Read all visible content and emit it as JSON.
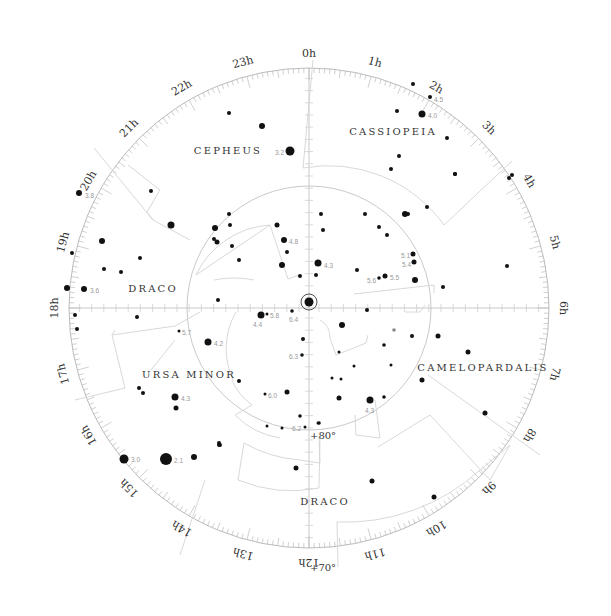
{
  "chart_data": {
    "type": "polar_star_chart",
    "title": "",
    "center": {
      "x": 309,
      "y": 308
    },
    "outer_radius": 240,
    "hour_labels": [
      "0h",
      "1h",
      "2h",
      "3h",
      "4h",
      "5h",
      "6h",
      "7h",
      "8h",
      "9h",
      "10h",
      "11h",
      "12h",
      "13h",
      "14h",
      "15h",
      "16h",
      "17h",
      "18h",
      "19h",
      "20h",
      "21h",
      "22h",
      "23h"
    ],
    "declination_circles": [
      {
        "label": "+80°",
        "radius": 122
      },
      {
        "label": "+70°",
        "radius": 240
      }
    ],
    "constellations": [
      {
        "name": "CEPHEUS",
        "x": 228,
        "y": 151
      },
      {
        "name": "CASSIOPEIA",
        "x": 393,
        "y": 132
      },
      {
        "name": "DRACO",
        "x": 153,
        "y": 289
      },
      {
        "name": "URSA MINOR",
        "x": 189,
        "y": 375
      },
      {
        "name": "CAMELOPARDALIS",
        "x": 483,
        "y": 368
      },
      {
        "name": "DRACO",
        "x": 325,
        "y": 502
      }
    ],
    "stars": [
      {
        "x": 309,
        "y": 302,
        "r": 4.5,
        "mag": "",
        "ring": true
      },
      {
        "x": 290,
        "y": 151,
        "r": 4.5,
        "mag": "3.2",
        "lx": 275,
        "ly": 153
      },
      {
        "x": 262,
        "y": 126,
        "r": 3,
        "mag": ""
      },
      {
        "x": 229,
        "y": 113,
        "r": 2,
        "mag": ""
      },
      {
        "x": 413,
        "y": 84,
        "r": 2,
        "mag": ""
      },
      {
        "x": 430,
        "y": 97,
        "r": 2,
        "mag": "4.5",
        "lx": 434,
        "ly": 100
      },
      {
        "x": 422,
        "y": 114,
        "r": 3.5,
        "mag": "4.0",
        "lx": 428,
        "ly": 116
      },
      {
        "x": 397,
        "y": 111,
        "r": 2,
        "mag": ""
      },
      {
        "x": 447,
        "y": 138,
        "r": 2,
        "mag": ""
      },
      {
        "x": 399,
        "y": 156,
        "r": 2,
        "mag": ""
      },
      {
        "x": 391,
        "y": 169,
        "r": 2,
        "mag": ""
      },
      {
        "x": 455,
        "y": 174,
        "r": 2,
        "mag": ""
      },
      {
        "x": 427,
        "y": 207,
        "r": 2,
        "mag": ""
      },
      {
        "x": 408,
        "y": 214,
        "r": 2,
        "mag": ""
      },
      {
        "x": 509,
        "y": 178,
        "r": 2,
        "mag": ""
      },
      {
        "x": 512,
        "y": 175,
        "r": 2,
        "mag": ""
      },
      {
        "x": 455,
        "y": 174,
        "r": 2,
        "mag": ""
      },
      {
        "x": 507,
        "y": 266,
        "r": 2,
        "mag": ""
      },
      {
        "x": 443,
        "y": 287,
        "r": 2,
        "mag": ""
      },
      {
        "x": 79,
        "y": 193,
        "r": 3,
        "mag": "3.8",
        "lx": 85,
        "ly": 196
      },
      {
        "x": 151,
        "y": 191,
        "r": 2,
        "mag": ""
      },
      {
        "x": 171,
        "y": 225,
        "r": 3.5,
        "mag": ""
      },
      {
        "x": 102,
        "y": 241,
        "r": 3,
        "mag": ""
      },
      {
        "x": 72,
        "y": 253,
        "r": 2,
        "mag": ""
      },
      {
        "x": 140,
        "y": 258,
        "r": 2,
        "mag": ""
      },
      {
        "x": 104,
        "y": 269,
        "r": 2,
        "mag": ""
      },
      {
        "x": 121,
        "y": 272,
        "r": 2,
        "mag": ""
      },
      {
        "x": 67,
        "y": 288,
        "r": 3,
        "mag": ""
      },
      {
        "x": 84,
        "y": 289,
        "r": 3,
        "mag": "3.6",
        "lx": 90,
        "ly": 291
      },
      {
        "x": 75,
        "y": 315,
        "r": 2,
        "mag": ""
      },
      {
        "x": 77,
        "y": 329,
        "r": 2,
        "mag": ""
      },
      {
        "x": 137,
        "y": 317,
        "r": 2,
        "mag": ""
      },
      {
        "x": 229,
        "y": 214,
        "r": 2,
        "mag": ""
      },
      {
        "x": 230,
        "y": 225,
        "r": 2,
        "mag": ""
      },
      {
        "x": 215,
        "y": 228,
        "r": 3,
        "mag": ""
      },
      {
        "x": 214,
        "y": 239,
        "r": 2,
        "mag": ""
      },
      {
        "x": 217,
        "y": 242,
        "r": 2.5,
        "mag": ""
      },
      {
        "x": 232,
        "y": 246,
        "r": 2,
        "mag": ""
      },
      {
        "x": 239,
        "y": 260,
        "r": 2,
        "mag": ""
      },
      {
        "x": 218,
        "y": 300,
        "r": 2,
        "mag": ""
      },
      {
        "x": 277,
        "y": 225,
        "r": 2.5,
        "mag": ""
      },
      {
        "x": 284,
        "y": 240,
        "r": 3,
        "mag": "4.8",
        "lx": 289,
        "ly": 242
      },
      {
        "x": 287,
        "y": 252,
        "r": 2,
        "mag": ""
      },
      {
        "x": 282,
        "y": 265,
        "r": 3,
        "mag": ""
      },
      {
        "x": 300,
        "y": 276,
        "r": 2,
        "mag": ""
      },
      {
        "x": 321,
        "y": 214,
        "r": 2,
        "mag": ""
      },
      {
        "x": 323,
        "y": 230,
        "r": 2,
        "mag": ""
      },
      {
        "x": 318,
        "y": 263,
        "r": 3.5,
        "mag": "4.3",
        "lx": 324,
        "ly": 266
      },
      {
        "x": 316,
        "y": 275,
        "r": 2,
        "mag": ""
      },
      {
        "x": 365,
        "y": 214,
        "r": 2,
        "mag": ""
      },
      {
        "x": 379,
        "y": 227,
        "r": 2,
        "mag": ""
      },
      {
        "x": 387,
        "y": 235,
        "r": 2,
        "mag": ""
      },
      {
        "x": 405,
        "y": 214,
        "r": 3,
        "mag": ""
      },
      {
        "x": 413,
        "y": 254,
        "r": 2.5,
        "mag": "5.1",
        "lx": 401,
        "ly": 256
      },
      {
        "x": 414,
        "y": 262,
        "r": 2.5,
        "mag": "5.4",
        "lx": 402,
        "ly": 265
      },
      {
        "x": 385,
        "y": 276,
        "r": 2.5,
        "mag": "5.5",
        "lx": 390,
        "ly": 278
      },
      {
        "x": 379,
        "y": 278,
        "r": 1.8,
        "mag": "5.6",
        "lx": 367,
        "ly": 281
      },
      {
        "x": 357,
        "y": 270,
        "r": 2,
        "mag": ""
      },
      {
        "x": 415,
        "y": 280,
        "r": 3,
        "mag": ""
      },
      {
        "x": 261,
        "y": 315,
        "r": 3.5,
        "mag": "4.4",
        "lx": 253,
        "ly": 325
      },
      {
        "x": 267,
        "y": 314,
        "r": 1.5,
        "mag": "5.8",
        "lx": 270,
        "ly": 316
      },
      {
        "x": 292,
        "y": 311,
        "r": 1.8,
        "mag": "6.4",
        "lx": 289,
        "ly": 320
      },
      {
        "x": 342,
        "y": 325,
        "r": 3,
        "mag": ""
      },
      {
        "x": 367,
        "y": 310,
        "r": 2,
        "mag": ""
      },
      {
        "x": 303,
        "y": 339,
        "r": 2,
        "mag": ""
      },
      {
        "x": 302,
        "y": 355,
        "r": 1.8,
        "mag": "6.3",
        "lx": 289,
        "ly": 357
      },
      {
        "x": 179,
        "y": 331,
        "r": 1.5,
        "mag": "5.7",
        "lx": 182,
        "ly": 333
      },
      {
        "x": 208,
        "y": 342,
        "r": 3.5,
        "mag": "4.2",
        "lx": 214,
        "ly": 344
      },
      {
        "x": 139,
        "y": 388,
        "r": 2,
        "mag": ""
      },
      {
        "x": 143,
        "y": 393,
        "r": 2,
        "mag": ""
      },
      {
        "x": 175,
        "y": 397,
        "r": 3.5,
        "mag": "4.3",
        "lx": 181,
        "ly": 399
      },
      {
        "x": 176,
        "y": 408,
        "r": 2.5,
        "mag": ""
      },
      {
        "x": 239,
        "y": 381,
        "r": 2,
        "mag": ""
      },
      {
        "x": 265,
        "y": 394,
        "r": 1.5,
        "mag": "6.0",
        "lx": 268,
        "ly": 396
      },
      {
        "x": 287,
        "y": 392,
        "r": 2.5,
        "mag": ""
      },
      {
        "x": 300,
        "y": 416,
        "r": 1.8,
        "mag": ""
      },
      {
        "x": 267,
        "y": 426,
        "r": 1.5,
        "mag": ""
      },
      {
        "x": 282,
        "y": 428,
        "r": 1.5,
        "mag": ""
      },
      {
        "x": 305,
        "y": 427,
        "r": 1.5,
        "mag": "6.2",
        "lx": 292,
        "ly": 429
      },
      {
        "x": 319,
        "y": 423,
        "r": 1.8,
        "mag": ""
      },
      {
        "x": 339,
        "y": 398,
        "r": 2.5,
        "mag": ""
      },
      {
        "x": 370,
        "y": 400,
        "r": 3.5,
        "mag": "4.3",
        "lx": 365,
        "ly": 411
      },
      {
        "x": 384,
        "y": 397,
        "r": 1.8,
        "mag": ""
      },
      {
        "x": 394,
        "y": 330,
        "r": 1.8,
        "mag": "",
        "grey": true
      },
      {
        "x": 339,
        "y": 352,
        "r": 1.5,
        "mag": ""
      },
      {
        "x": 354,
        "y": 366,
        "r": 1.5,
        "mag": ""
      },
      {
        "x": 332,
        "y": 378,
        "r": 1.5,
        "mag": ""
      },
      {
        "x": 341,
        "y": 379,
        "r": 1.5,
        "mag": ""
      },
      {
        "x": 384,
        "y": 345,
        "r": 1.8,
        "mag": ""
      },
      {
        "x": 391,
        "y": 365,
        "r": 1.5,
        "mag": ""
      },
      {
        "x": 412,
        "y": 336,
        "r": 2,
        "mag": ""
      },
      {
        "x": 438,
        "y": 336,
        "r": 2.5,
        "mag": ""
      },
      {
        "x": 468,
        "y": 352,
        "r": 2.5,
        "mag": ""
      },
      {
        "x": 422,
        "y": 380,
        "r": 2.5,
        "mag": ""
      },
      {
        "x": 485,
        "y": 413,
        "r": 2.5,
        "mag": ""
      },
      {
        "x": 318,
        "y": 423,
        "r": 1.5,
        "mag": ""
      },
      {
        "x": 124,
        "y": 459,
        "r": 4.5,
        "mag": "3.0",
        "lx": 131,
        "ly": 460
      },
      {
        "x": 166,
        "y": 459,
        "r": 6,
        "mag": "2.1",
        "lx": 174,
        "ly": 461
      },
      {
        "x": 194,
        "y": 457,
        "r": 3,
        "mag": ""
      },
      {
        "x": 220,
        "y": 445,
        "r": 2,
        "mag": ""
      },
      {
        "x": 219,
        "y": 445,
        "r": 2,
        "mag": ""
      },
      {
        "x": 296,
        "y": 468,
        "r": 2.5,
        "mag": ""
      },
      {
        "x": 372,
        "y": 481,
        "r": 2.5,
        "mag": ""
      },
      {
        "x": 434,
        "y": 497,
        "r": 2.5,
        "mag": ""
      },
      {
        "x": 219,
        "y": 443,
        "r": 2,
        "mag": ""
      }
    ],
    "boundaries": [
      "M 313 60 L 303 168",
      "M 303 168 A 142 142 0 0 1 444 225",
      "M 444 225 L 512 161",
      "M 94 148 L 153 220",
      "M 153 220 L 147 212 L 160 190 L 128 165 M 153 220 L 190 240",
      "M 270 225 A 88 88 0 0 0 196 275",
      "M 196 275 L 270 225 L 288 279 L 299 275",
      "M 214 280 A 100 100 0 0 1 254 280",
      "M 354 294 L 434 285 L 434 293",
      "M 320 320 A 20 20 0 0 1 330 338 L 336 355 L 366 343 L 368 335",
      "M 236 312 A 74 74 0 0 0 233 380",
      "M 232 380 A 60 60 0 0 0 252 405",
      "M 252 405 L 235 415 A 80 80 0 0 0 280 438",
      "M 115 330 L 112 335 L 125 388 L 75 400",
      "M 112 335 L 175 326 L 200 312",
      "M 355 415 L 356 435 L 380 438 L 375 400",
      "M 378 447 L 430 415 L 490 480 L 510 445",
      "M 244 443 A 130 130 0 0 0 300 460 L 320 463 L 319 437",
      "M 244 443 L 238 480 A 140 140 0 0 0 319 488",
      "M 319 488 L 320 437",
      "M 205 480 L 180 555",
      "M 337 522 L 338 567",
      "M 337 522 A 200 200 0 0 0 480 470 L 510 445",
      "M 428 375 L 540 455",
      "M 425 305 L 420 312 L 405 312",
      "M 151 370 L 175 340"
    ]
  },
  "labels": {
    "dec_80": "+80°",
    "dec_70": "+70°"
  }
}
